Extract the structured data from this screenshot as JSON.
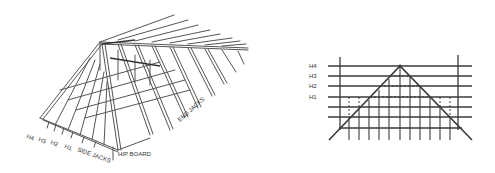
{
  "left_figure": {
    "title": "Hip roof framing - isometric view",
    "labels": {
      "h4": "H4",
      "h3": "H3",
      "h2": "H2",
      "h1": "H1",
      "side_jacks": "SIDE JACKS",
      "hip_board": "HIP BOARD",
      "end_jacks": "END JACKS"
    }
  },
  "right_figure": {
    "title": "Hip roof framing - elevation view",
    "labels": {
      "h4": "H4",
      "h3": "H3",
      "h2": "H2",
      "h1": "H1"
    }
  },
  "colors": {
    "line": "#3a3a3a",
    "background": "#ffffff"
  }
}
